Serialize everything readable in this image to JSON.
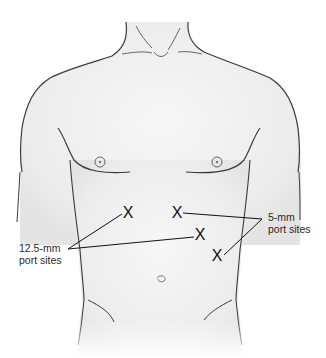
{
  "figure": {
    "marker_glyph": "X",
    "colors": {
      "skin_fill": "#f1f1f1",
      "outline": "#3a3a3a",
      "text": "#2a2a2a",
      "background": "#ffffff"
    }
  },
  "labels": {
    "large_ports": {
      "line1": "12.5-mm",
      "line2": "port sites"
    },
    "small_ports": {
      "line1": "5-mm",
      "line2": "port sites"
    }
  },
  "port_sites": [
    {
      "id": "left-upper",
      "size": "12.5-mm",
      "marker": "X"
    },
    {
      "id": "center-upper",
      "size": "5-mm",
      "marker": "X"
    },
    {
      "id": "right-middle",
      "size": "12.5-mm",
      "marker": "X"
    },
    {
      "id": "right-lower",
      "size": "5-mm",
      "marker": "X"
    }
  ]
}
